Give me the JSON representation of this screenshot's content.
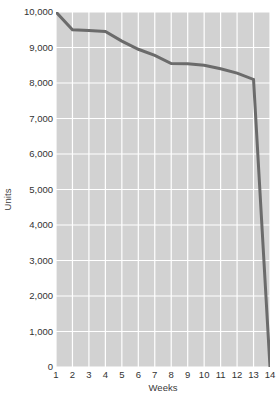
{
  "chart_data": {
    "type": "line",
    "title": "",
    "subtitle": "",
    "xlabel": "Weeks",
    "ylabel": "Units",
    "x": [
      1,
      2,
      3,
      4,
      5,
      6,
      7,
      8,
      9,
      10,
      11,
      12,
      13,
      14
    ],
    "categories": [
      "1",
      "2",
      "3",
      "4",
      "5",
      "6",
      "7",
      "8",
      "9",
      "10",
      "11",
      "12",
      "13",
      "14"
    ],
    "values": [
      10000,
      9500,
      9480,
      9450,
      9180,
      8950,
      8780,
      8550,
      8540,
      8500,
      8400,
      8280,
      8100,
      0
    ],
    "series": [
      {
        "name": "Units",
        "values": [
          10000,
          9500,
          9480,
          9450,
          9180,
          8950,
          8780,
          8550,
          8540,
          8500,
          8400,
          8280,
          8100,
          0
        ]
      }
    ],
    "xlim": [
      1,
      14
    ],
    "ylim": [
      0,
      10000
    ],
    "y_ticks": [
      0,
      1000,
      2000,
      3000,
      4000,
      5000,
      6000,
      7000,
      8000,
      9000,
      10000
    ],
    "y_tick_labels": [
      "0",
      "1,000",
      "2,000",
      "3,000",
      "4,000",
      "5,000",
      "6,000",
      "7,000",
      "8,000",
      "9,000",
      "10,000"
    ],
    "x_ticks": [
      1,
      2,
      3,
      4,
      5,
      6,
      7,
      8,
      9,
      10,
      11,
      12,
      13,
      14
    ],
    "x_tick_labels": [
      "1",
      "2",
      "3",
      "4",
      "5",
      "6",
      "7",
      "8",
      "9",
      "10",
      "11",
      "12",
      "13",
      "14"
    ],
    "grid": true,
    "grid_color": "#ffffff",
    "plot_background": "#d2d2d2",
    "figure_background": "#ffffff",
    "line_color": "#6b6b6b",
    "line_width": 3,
    "legend": false,
    "legend_position": "none",
    "markers": false,
    "annotations": []
  }
}
